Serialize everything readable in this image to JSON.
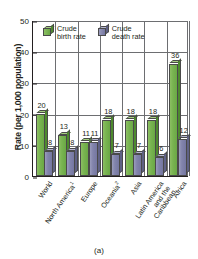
{
  "chart_data": {
    "type": "bar",
    "title": "",
    "caption": "(a)",
    "xlabel": "",
    "ylabel": "Rate (per 1,000 population)",
    "ylim": [
      0,
      50
    ],
    "yticks": [
      0,
      10,
      20,
      30,
      40,
      50
    ],
    "grid": "horizontal-and-vertical",
    "legend_position": "top-inside",
    "categories": [
      "World",
      "North America",
      "Europe",
      "Oceania",
      "Asia",
      "Latin America and the Caribbean",
      "Africa"
    ],
    "category_lines": [
      [
        "World"
      ],
      [
        "North America"
      ],
      [
        "Europe"
      ],
      [
        "Oceania"
      ],
      [
        "Asia"
      ],
      [
        "Latin America",
        "and the",
        "Caribbean"
      ],
      [
        "Africa"
      ]
    ],
    "category_footnotes": [
      "",
      "1",
      "",
      "2",
      "",
      "",
      ""
    ],
    "series": [
      {
        "name": "Crude birth rate",
        "color": "#6aa845",
        "values": [
          20,
          13,
          11,
          18,
          18,
          18,
          36
        ]
      },
      {
        "name": "Crude death rate",
        "color": "#7577a1",
        "values": [
          8,
          8,
          11,
          7,
          7,
          6,
          12
        ]
      }
    ]
  },
  "legend": {
    "items": [
      {
        "line1": "Crude",
        "line2": "birth rate",
        "swatch": "green-cube-icon"
      },
      {
        "line1": "Crude",
        "line2": "death rate",
        "swatch": "slate-cube-icon"
      }
    ]
  }
}
